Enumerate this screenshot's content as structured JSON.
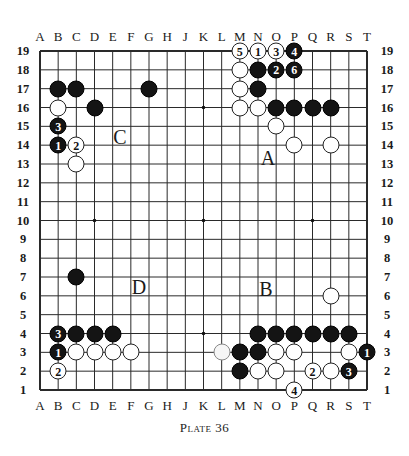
{
  "diagram": {
    "caption": "Plate 36",
    "board_size": 19,
    "columns": [
      "A",
      "B",
      "C",
      "D",
      "E",
      "F",
      "G",
      "H",
      "J",
      "K",
      "L",
      "M",
      "N",
      "O",
      "P",
      "Q",
      "R",
      "S",
      "T"
    ],
    "rows": [
      "19",
      "18",
      "17",
      "16",
      "15",
      "14",
      "13",
      "12",
      "11",
      "10",
      "9",
      "8",
      "7",
      "6",
      "5",
      "4",
      "3",
      "2",
      "1"
    ],
    "star_points": [
      "D4",
      "K4",
      "Q4",
      "D10",
      "K10",
      "Q10",
      "D16",
      "K16",
      "Q16"
    ],
    "stones": [
      {
        "pos": "M19",
        "color": "white",
        "label": "5"
      },
      {
        "pos": "N19",
        "color": "white",
        "label": "1"
      },
      {
        "pos": "O19",
        "color": "white",
        "label": "3"
      },
      {
        "pos": "P19",
        "color": "black",
        "label": "4"
      },
      {
        "pos": "M18",
        "color": "white",
        "label": ""
      },
      {
        "pos": "N18",
        "color": "black",
        "label": ""
      },
      {
        "pos": "O18",
        "color": "black",
        "label": "2"
      },
      {
        "pos": "P18",
        "color": "black",
        "label": "6"
      },
      {
        "pos": "M17",
        "color": "white",
        "label": ""
      },
      {
        "pos": "N17",
        "color": "black",
        "label": ""
      },
      {
        "pos": "M16",
        "color": "white",
        "label": ""
      },
      {
        "pos": "N16",
        "color": "white",
        "label": ""
      },
      {
        "pos": "O16",
        "color": "black",
        "label": ""
      },
      {
        "pos": "P16",
        "color": "black",
        "label": ""
      },
      {
        "pos": "Q16",
        "color": "black",
        "label": ""
      },
      {
        "pos": "R16",
        "color": "black",
        "label": ""
      },
      {
        "pos": "O15",
        "color": "white",
        "label": ""
      },
      {
        "pos": "P14",
        "color": "white",
        "label": ""
      },
      {
        "pos": "R14",
        "color": "white",
        "label": ""
      },
      {
        "pos": "B17",
        "color": "black",
        "label": ""
      },
      {
        "pos": "C17",
        "color": "black",
        "label": ""
      },
      {
        "pos": "G17",
        "color": "black",
        "label": ""
      },
      {
        "pos": "B16",
        "color": "white",
        "label": ""
      },
      {
        "pos": "D16",
        "color": "black",
        "label": ""
      },
      {
        "pos": "B15",
        "color": "black",
        "label": "3"
      },
      {
        "pos": "B14",
        "color": "black",
        "label": "1"
      },
      {
        "pos": "C14",
        "color": "white",
        "label": "2"
      },
      {
        "pos": "C13",
        "color": "white",
        "label": ""
      },
      {
        "pos": "C7",
        "color": "black",
        "label": ""
      },
      {
        "pos": "R6",
        "color": "white",
        "label": ""
      },
      {
        "pos": "B4",
        "color": "black",
        "label": "3"
      },
      {
        "pos": "C4",
        "color": "black",
        "label": ""
      },
      {
        "pos": "D4",
        "color": "black",
        "label": ""
      },
      {
        "pos": "E4",
        "color": "black",
        "label": ""
      },
      {
        "pos": "B3",
        "color": "black",
        "label": "1"
      },
      {
        "pos": "C3",
        "color": "white",
        "label": ""
      },
      {
        "pos": "D3",
        "color": "white",
        "label": ""
      },
      {
        "pos": "E3",
        "color": "white",
        "label": ""
      },
      {
        "pos": "F3",
        "color": "white",
        "label": ""
      },
      {
        "pos": "B2",
        "color": "white",
        "label": "2"
      },
      {
        "pos": "N4",
        "color": "black",
        "label": ""
      },
      {
        "pos": "O4",
        "color": "black",
        "label": ""
      },
      {
        "pos": "P4",
        "color": "black",
        "label": ""
      },
      {
        "pos": "Q4",
        "color": "black",
        "label": ""
      },
      {
        "pos": "R4",
        "color": "black",
        "label": ""
      },
      {
        "pos": "S4",
        "color": "black",
        "label": ""
      },
      {
        "pos": "L3",
        "color": "white",
        "label": "",
        "faded": true
      },
      {
        "pos": "M3",
        "color": "black",
        "label": ""
      },
      {
        "pos": "N3",
        "color": "black",
        "label": ""
      },
      {
        "pos": "O3",
        "color": "white",
        "label": ""
      },
      {
        "pos": "P3",
        "color": "white",
        "label": ""
      },
      {
        "pos": "S3",
        "color": "white",
        "label": ""
      },
      {
        "pos": "T3",
        "color": "black",
        "label": "1"
      },
      {
        "pos": "M2",
        "color": "black",
        "label": ""
      },
      {
        "pos": "N2",
        "color": "white",
        "label": ""
      },
      {
        "pos": "O2",
        "color": "white",
        "label": ""
      },
      {
        "pos": "Q2",
        "color": "white",
        "label": "2"
      },
      {
        "pos": "R2",
        "color": "white",
        "label": ""
      },
      {
        "pos": "S2",
        "color": "black",
        "label": "3"
      },
      {
        "pos": "P1",
        "color": "white",
        "label": "4"
      }
    ],
    "region_markers": [
      {
        "label": "A",
        "x": 268,
        "y": 158
      },
      {
        "label": "B",
        "x": 266,
        "y": 289
      },
      {
        "label": "C",
        "x": 120,
        "y": 137
      },
      {
        "label": "D",
        "x": 139,
        "y": 287
      }
    ],
    "colors": {
      "grid_line": "#2a2a2a",
      "border": "#111111",
      "black_stone": "#141414",
      "white_stone": "#ffffff"
    }
  }
}
